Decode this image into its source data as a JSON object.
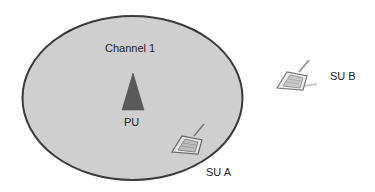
{
  "diagram": {
    "channel": {
      "label": "Channel 1",
      "fill": "#cfcfcf",
      "stroke": "#3a3a3a"
    },
    "primary_user": {
      "label": "PU",
      "color": "#5a5a5a"
    },
    "secondary_users": [
      {
        "label": "SU A"
      },
      {
        "label": "SU B"
      }
    ]
  }
}
